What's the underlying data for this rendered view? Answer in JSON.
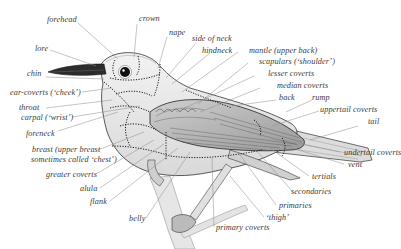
{
  "diagram": {
    "colors": {
      "background": "#ffffff",
      "label_text": "#3a3a3a",
      "leader_line": "#8a8a8a",
      "outline": "#333333",
      "tract_boundary": "#1a1a1a"
    },
    "labels": {
      "forehead": "forehead",
      "crown": "crown",
      "nape": "nape",
      "side_of_neck": "side of neck",
      "hindneck": "hindneck",
      "lore": "lore",
      "mantle": "mantle (upper back)",
      "scapulars": "scapulars (‘shoulder’)",
      "lesser_coverts": "lesser coverts",
      "median_coverts": "median coverts",
      "chin": "chin",
      "back": "back",
      "rump": "rump",
      "ear_coverts": "ear-coverts (‘cheek’)",
      "uppertail_coverts": "uppertail coverts",
      "throat": "throat",
      "tail": "tail",
      "carpal": "carpal (‘wrist’)",
      "forneck": "foreneck",
      "breast_line1": "breast (upper breast",
      "breast_line2": "sometimes called ‘chest’)",
      "undertail_coverts": "undertail coverts",
      "vent": "vent",
      "greater_coverts": "greater coverts",
      "tertials": "tertials",
      "alula": "alula",
      "secondaries": "secondaries",
      "flank": "flank",
      "primaries": "primaries",
      "thigh": "‘thigh’",
      "belly": "belly",
      "primary_coverts": "primary coverts"
    }
  }
}
